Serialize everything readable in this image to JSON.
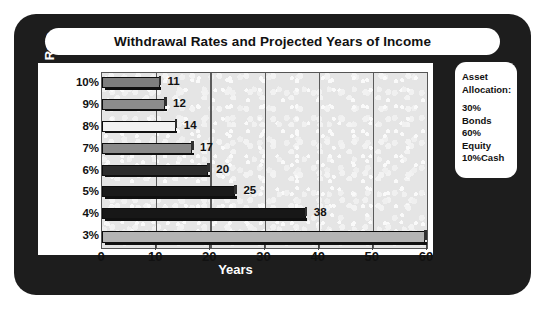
{
  "title": "Withdrawal Rates and Projected Years of Income",
  "axis": {
    "y_title": "Withdrawl Rate",
    "x_title": "Years"
  },
  "asset_box": {
    "heading_line1": "Asset",
    "heading_line2": "Allocation:",
    "items": [
      "30% Bonds",
      "60% Equity",
      "10%Cash"
    ]
  },
  "colors": {
    "frame": "#1d1d1d",
    "panel": "#ffffff",
    "plot_background": "#e6e6e6",
    "gridline": "#5a5a5a",
    "text": "#111111",
    "frame_text": "#ffffff"
  },
  "chart_data": {
    "type": "bar",
    "orientation": "horizontal",
    "title": "Withdrawal Rates and Projected Years of Income",
    "xlabel": "Years",
    "ylabel": "Withdrawl Rate",
    "categories": [
      "10%",
      "9%",
      "8%",
      "7%",
      "6%",
      "5%",
      "4%",
      "3%"
    ],
    "values": [
      11,
      12,
      14,
      17,
      20,
      25,
      38,
      60
    ],
    "data_labels": [
      "11",
      "12",
      "14",
      "17",
      "20",
      "25",
      "38",
      ""
    ],
    "bar_colors": [
      "#7e7e7e",
      "#8c8c8c",
      "#f2f2f2",
      "#8a8a8a",
      "#2c2c2c",
      "#1a1a1a",
      "#171717",
      "#b4b4b4"
    ],
    "xlim": [
      0,
      60
    ],
    "xticks": [
      0,
      10,
      20,
      30,
      40,
      50,
      60
    ],
    "xtick_labels": [
      "0",
      "10",
      "20",
      "30",
      "40",
      "50",
      "60"
    ],
    "grid": true,
    "grid_axis": "x",
    "legend": false,
    "annotations": [
      "30% Bonds",
      "60% Equity",
      "10%Cash"
    ]
  }
}
